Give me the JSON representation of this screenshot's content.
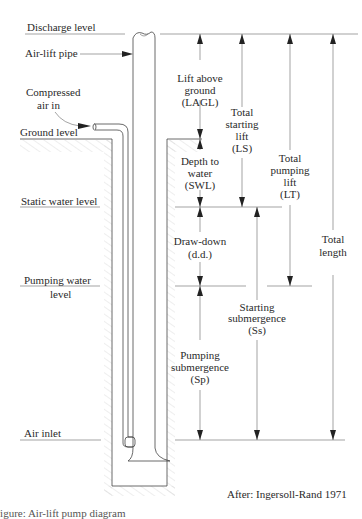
{
  "diagram": {
    "levels": [
      {
        "id": "discharge",
        "label": "Discharge level",
        "y": 34
      },
      {
        "id": "ground",
        "label": "Ground level",
        "y": 139
      },
      {
        "id": "static",
        "label": "Static water level",
        "y": 207
      },
      {
        "id": "pumping",
        "label_line1": "Pumping water",
        "label_line2": "level",
        "y": 286
      },
      {
        "id": "air_inlet",
        "label": "Air inlet",
        "y": 440
      }
    ],
    "components": {
      "air_lift_pipe": "Air-lift pipe",
      "compressed_air_line1": "Compressed",
      "compressed_air_line2": "air in"
    },
    "dimensions": [
      {
        "id": "lagl",
        "lines": [
          "Lift above",
          "ground",
          "(LAGL)"
        ]
      },
      {
        "id": "swl",
        "lines": [
          "Depth to",
          "water",
          "(SWL)"
        ]
      },
      {
        "id": "dd",
        "lines": [
          "Draw-down",
          "(d.d.)"
        ]
      },
      {
        "id": "sp",
        "lines": [
          "Pumping",
          "submergence",
          "(Sp)"
        ]
      },
      {
        "id": "ls",
        "lines": [
          "Total",
          "starting",
          "lift",
          "(LS)"
        ]
      },
      {
        "id": "ss",
        "lines": [
          "Starting",
          "submergence",
          "(Ss)"
        ]
      },
      {
        "id": "lt",
        "lines": [
          "Total",
          "pumping",
          "lift",
          "(LT)"
        ]
      },
      {
        "id": "total",
        "lines": [
          "Total",
          "length"
        ]
      }
    ],
    "source": "After: Ingersoll-Rand 1971",
    "caption_partial": "Figure: Air-lift pump diagram"
  }
}
